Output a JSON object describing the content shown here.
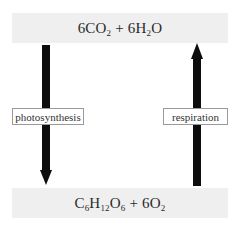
{
  "diagram": {
    "type": "cycle",
    "top_formula": {
      "parts": [
        {
          "text": "6CO"
        },
        {
          "sub": "2"
        },
        {
          "text": " + 6H"
        },
        {
          "sub": "2"
        },
        {
          "text": "O"
        }
      ],
      "plain": "6CO2 + 6H2O"
    },
    "bottom_formula": {
      "parts": [
        {
          "text": "C"
        },
        {
          "sub": "6"
        },
        {
          "text": "H"
        },
        {
          "sub": "12"
        },
        {
          "text": "O"
        },
        {
          "sub": "6"
        },
        {
          "text": " + 6O"
        },
        {
          "sub": "2"
        }
      ],
      "plain": "C6H12O6 + 6O2"
    },
    "arrows": [
      {
        "id": "left",
        "direction": "down",
        "label": "photosynthesis",
        "from": "top_formula",
        "to": "bottom_formula"
      },
      {
        "id": "right",
        "direction": "up",
        "label": "respiration",
        "from": "bottom_formula",
        "to": "top_formula"
      }
    ],
    "colors": {
      "formula_box_bg": "#efefef",
      "arrow": "#0d0d0d",
      "label_border": "#9a9a9a"
    }
  }
}
